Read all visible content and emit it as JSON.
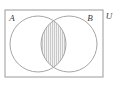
{
  "figure": {
    "type": "venn-2-set",
    "shaded_region": "A intersect B",
    "shading_style": "vertical-hatch",
    "background_color": "#ffffff",
    "stroke_color": "#9a9a9a",
    "label_color": "#3a3a3a",
    "hatch_color": "#c9c9c9",
    "shade_fill_color": "#ebebeb"
  },
  "universe": {
    "label": "U",
    "rect": {
      "x": 5,
      "y": 10,
      "width": 98,
      "height": 67
    }
  },
  "sets": [
    {
      "key": "A",
      "label": "A",
      "label_x": 12,
      "label_y": 21,
      "circle": {
        "cx": 38,
        "cy": 44,
        "r": 28
      }
    },
    {
      "key": "B",
      "label": "B",
      "label_x": 90,
      "label_y": 21,
      "circle": {
        "cx": 69,
        "cy": 44,
        "r": 28
      }
    }
  ]
}
